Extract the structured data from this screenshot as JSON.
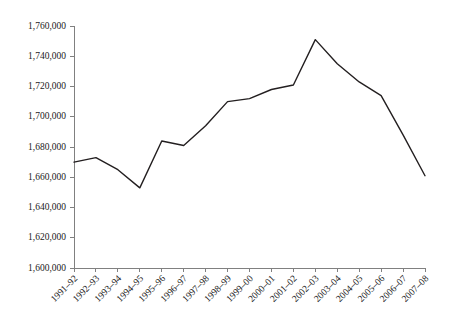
{
  "chart_data": {
    "type": "line",
    "title": "",
    "subtitle": "",
    "xlabel": "",
    "ylabel": "",
    "ylim": [
      1600000,
      1760000
    ],
    "ytick_step": 20000,
    "grid": false,
    "legend": null,
    "legend_position": "none",
    "line_color": "#231f20",
    "axis_color": "#808080",
    "categories": [
      "1991–92",
      "1992–93",
      "1993–94",
      "1994–95",
      "1995–96",
      "1996–97",
      "1997–98",
      "1998–99",
      "1999–00",
      "2000–01",
      "2001–02",
      "2002–03",
      "2003–04",
      "2004–05",
      "2005–06",
      "2006–07",
      "2007–08"
    ],
    "values": [
      1670000,
      1673000,
      1665000,
      1653000,
      1684000,
      1681000,
      1694000,
      1710000,
      1712000,
      1718000,
      1721000,
      1751000,
      1735000,
      1723000,
      1714000,
      1688000,
      1661000
    ],
    "ytick_labels": [
      "1,600,000",
      "1,620,000",
      "1,640,000",
      "1,660,000",
      "1,680,000",
      "1,700,000",
      "1,720,000",
      "1,740,000",
      "1,760,000"
    ],
    "ytick_values": [
      1600000,
      1620000,
      1640000,
      1660000,
      1680000,
      1700000,
      1720000,
      1740000,
      1760000
    ]
  }
}
